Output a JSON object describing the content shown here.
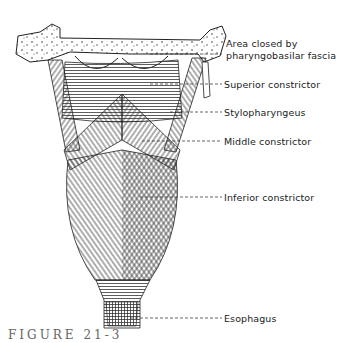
{
  "figure": {
    "caption": "FIGURE 21-3"
  },
  "labels": [
    {
      "id": "area-closed",
      "text_line1": "Area closed by",
      "text_line2": "pharyngobasilar fascia"
    },
    {
      "id": "superior-constrictor",
      "text": "Superior constrictor"
    },
    {
      "id": "stylopharyngeus",
      "text": "Stylopharyngeus"
    },
    {
      "id": "middle-constrictor",
      "text": "Middle constrictor"
    },
    {
      "id": "inferior-constrictor",
      "text": "Inferior constrictor"
    },
    {
      "id": "esophagus",
      "text": "Esophagus"
    }
  ],
  "colors": {
    "ink": "#222222",
    "background": "#ffffff"
  }
}
